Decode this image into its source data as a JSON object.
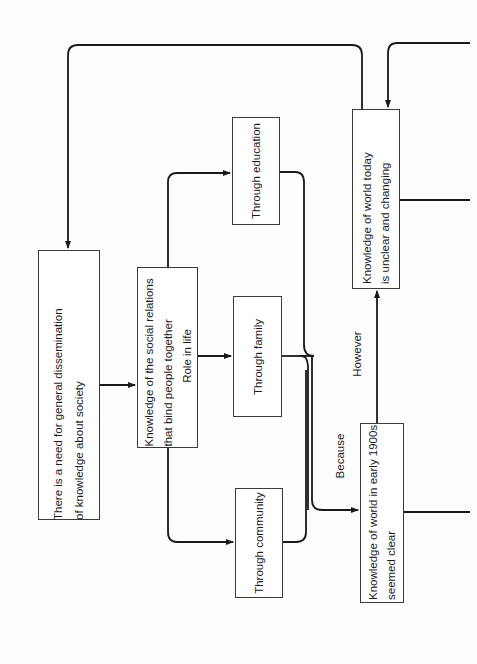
{
  "diagram": {
    "orientation": "rotated-90-ccw",
    "nodes": {
      "need": {
        "lines": [
          "There is a need for general dissemination",
          "of knowledge about society"
        ]
      },
      "social": {
        "lines": [
          "Knowledge of the social relations",
          "that bind people together",
          "Role in life"
        ]
      },
      "education": {
        "lines": [
          "Through education"
        ]
      },
      "family": {
        "lines": [
          "Through family"
        ]
      },
      "community": {
        "lines": [
          "Through community"
        ]
      },
      "early1900s": {
        "lines": [
          "Knowledge of world in early 1900s",
          "seemed clear"
        ]
      },
      "today": {
        "lines": [
          "Knowledge of world today",
          "is unclear and changing"
        ]
      }
    },
    "edge_labels": {
      "because": "Because",
      "however": "However"
    },
    "edges": [
      {
        "from": "need",
        "to": "social"
      },
      {
        "from": "social",
        "to": "education"
      },
      {
        "from": "social",
        "to": "family"
      },
      {
        "from": "social",
        "to": "community"
      },
      {
        "from": "education",
        "to": "early1900s",
        "label": "Because"
      },
      {
        "from": "family",
        "to": "early1900s",
        "label": "Because"
      },
      {
        "from": "community",
        "to": "early1900s",
        "label": "Because"
      },
      {
        "from": "early1900s",
        "to": "today",
        "label": "However"
      },
      {
        "from": "today",
        "to": "need"
      },
      {
        "from": "offpage-right",
        "to": "today"
      },
      {
        "from": "today",
        "to": "offpage-right"
      },
      {
        "from": "early1900s",
        "to": "offpage-right"
      }
    ],
    "colors": {
      "line": "#1a1a1a",
      "box_border": "#3a3a3a",
      "background": "#fdfdfd"
    }
  }
}
